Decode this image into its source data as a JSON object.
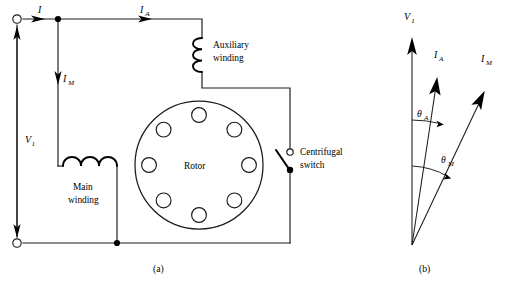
{
  "figure": {
    "background_color": "#ffffff",
    "line_color": "#1a1a1a",
    "width": 507,
    "height": 285
  },
  "circuit": {
    "caption": "(a)",
    "labels": {
      "supply_voltage": "V",
      "supply_voltage_sub": "1",
      "line_current": "I",
      "aux_current": "I",
      "aux_current_sub": "A",
      "main_current": "I",
      "main_current_sub": "M",
      "aux_winding_line1": "Auxiliary",
      "aux_winding_line2": "winding",
      "main_winding_line1": "Main",
      "main_winding_line2": "winding",
      "rotor": "Rotor",
      "switch_line1": "Centrifugal",
      "switch_line2": "switch"
    },
    "components": {
      "auxiliary_winding": {
        "type": "inductor-coil",
        "turns": 3,
        "orientation": "vertical"
      },
      "main_winding": {
        "type": "inductor-coil",
        "turns": 3,
        "orientation": "horizontal"
      },
      "rotor": {
        "type": "circle",
        "bore_count": 8
      },
      "centrifugal_switch": {
        "type": "spst-switch",
        "state": "open"
      },
      "terminals": 2,
      "junction_nodes": 2
    }
  },
  "phasor": {
    "caption": "(b)",
    "vectors": [
      {
        "name": "V1",
        "label": "V",
        "sublabel": "1",
        "angle_deg_from_vertical": 0,
        "description": "supply voltage reference phasor"
      },
      {
        "name": "IA",
        "label": "I",
        "sublabel": "A",
        "angle_deg_from_vertical": 13,
        "description": "auxiliary winding current"
      },
      {
        "name": "IM",
        "label": "I",
        "sublabel": "M",
        "angle_deg_from_vertical": 32,
        "description": "main winding current"
      }
    ],
    "angles": [
      {
        "name": "theta_A",
        "label": "θ",
        "sublabel": "A",
        "between": [
          "V1",
          "IA"
        ],
        "value_deg": 13
      },
      {
        "name": "theta_M",
        "label": "θ",
        "sublabel": "M",
        "between": [
          "V1",
          "IM"
        ],
        "value_deg": 32
      }
    ]
  }
}
